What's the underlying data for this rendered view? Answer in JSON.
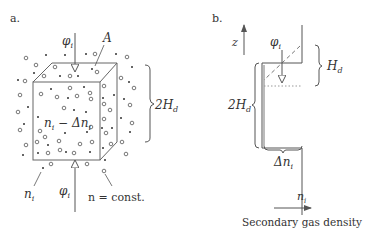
{
  "panel_a": {
    "label": "a.",
    "flux_top": "φ",
    "flux_top_sub": "i",
    "area_label": "A",
    "height_label": "2H",
    "height_sub": "d",
    "inner_density": "n",
    "inner_density_sub": "i",
    "inner_density_rest": " − Δn",
    "inner_density_rest_sub": "i",
    "outer_density": "n",
    "outer_density_sub": "i",
    "flux_bottom": "φ",
    "flux_bottom_sub": "i",
    "const_label": "n = const."
  },
  "panel_b": {
    "label": "b.",
    "axis_z": "z",
    "flux": "φ",
    "flux_sub": "i",
    "hd_label": "H",
    "hd_sub": "d",
    "twohd_label": "2H",
    "twohd_sub": "d",
    "delta_label": "Δn",
    "delta_sub": "i",
    "ni_label": "n",
    "ni_sub": "i",
    "x_axis_label": "Secondary gas density"
  },
  "colors": {
    "line": "#555555",
    "text": "#333333",
    "dashed": "#777777",
    "dotted": "#999999"
  }
}
